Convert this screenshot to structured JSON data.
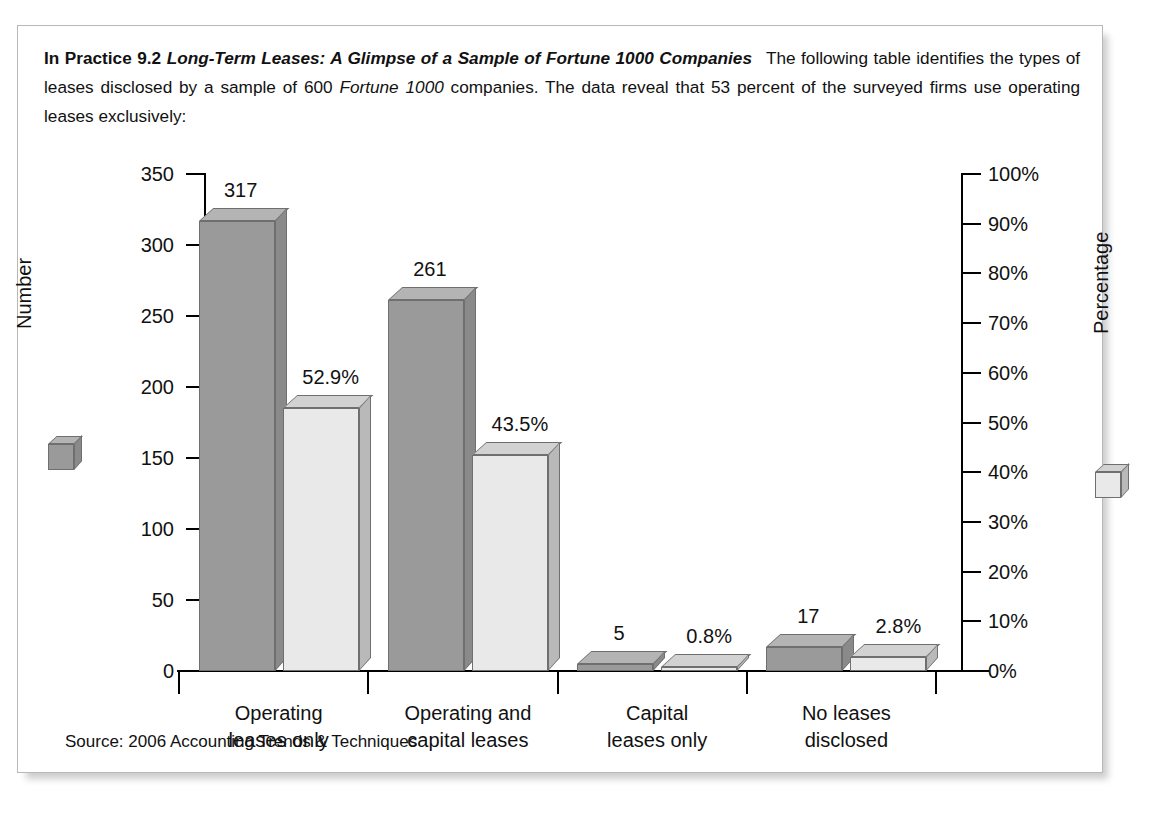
{
  "card": {
    "intro": {
      "lead": "In Practice 9.2",
      "lead_italic": "Long-Term Leases: A Glimpse of a Sample of Fortune 1000 Companies",
      "body_1": "The following table identifies the types of leases disclosed by a sample of 600 ",
      "body_italic": "Fortune 1000",
      "body_2": " companies. The data reveal that 53 percent of the surveyed firms use operating leases exclusively:"
    },
    "source_note": "Source: 2006 Accounting Trends & Techniques"
  },
  "chart_data": {
    "type": "bar",
    "title": "",
    "xlabel": "",
    "categories": [
      "Operating\nleases only",
      "Operating and\ncapital leases",
      "Capital\nleases only",
      "No leases\ndisclosed"
    ],
    "category_lines": [
      [
        "Operating",
        "leases only"
      ],
      [
        "Operating and",
        "capital leases"
      ],
      [
        "Capital",
        "leases only"
      ],
      [
        "No leases",
        "disclosed"
      ]
    ],
    "series": [
      {
        "name": "Number",
        "axis": "left",
        "values": [
          317,
          261,
          5,
          17
        ],
        "labels": [
          "317",
          "261",
          "5",
          "17"
        ],
        "color": "#9a9a9a"
      },
      {
        "name": "Percentage",
        "axis": "right",
        "values": [
          52.9,
          43.5,
          0.8,
          2.8
        ],
        "labels": [
          "52.9%",
          "43.5%",
          "0.8%",
          "2.8%"
        ],
        "color": "#e9e9e9"
      }
    ],
    "left_axis": {
      "label": "Number",
      "ylim": [
        0,
        350
      ],
      "ticks": [
        0,
        50,
        100,
        150,
        200,
        250,
        300,
        350
      ],
      "tick_labels": [
        "0",
        "50",
        "100",
        "150",
        "200",
        "250",
        "300",
        "350"
      ]
    },
    "right_axis": {
      "label": "Percentage",
      "ylim": [
        0,
        100
      ],
      "ticks": [
        0,
        10,
        20,
        30,
        40,
        50,
        60,
        70,
        80,
        90,
        100
      ],
      "tick_labels": [
        "0%",
        "10%",
        "20%",
        "30%",
        "40%",
        "50%",
        "60%",
        "70%",
        "80%",
        "90%",
        "100%"
      ]
    },
    "grid": false,
    "legend_position": "axis-titles"
  }
}
